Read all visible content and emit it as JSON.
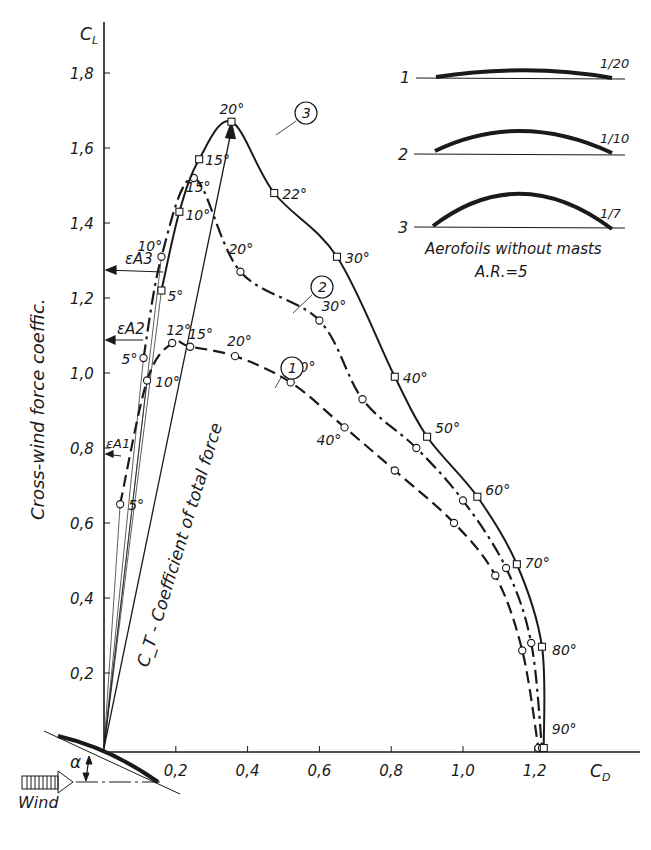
{
  "chart_data": {
    "type": "line",
    "xlabel": "C_D",
    "ylabel": "C_L",
    "ylabel_text": "Cross-wind force coeffic.",
    "total_force_label": "C_T - Coefficient of total force",
    "x_ticks": [
      "0,2",
      "0,4",
      "0,6",
      "0,8",
      "1,0",
      "1,2"
    ],
    "y_ticks": [
      "0,2",
      "0,4",
      "0,6",
      "0,8",
      "1,0",
      "1,2",
      "1,4",
      "1,6",
      "1,8"
    ],
    "xlim": [
      0,
      1.4
    ],
    "ylim": [
      0,
      1.9
    ],
    "grid": false,
    "series": [
      {
        "name": "1",
        "camber": "1/20",
        "style": "dashed",
        "marker": "circle",
        "points": [
          {
            "angle": "5°",
            "cd": 0.045,
            "cl": 0.65
          },
          {
            "angle": "10°",
            "cd": 0.12,
            "cl": 0.98
          },
          {
            "angle": "12°",
            "cd": 0.19,
            "cl": 1.08
          },
          {
            "angle": "15°",
            "cd": 0.24,
            "cl": 1.07
          },
          {
            "angle": "20°",
            "cd": 0.365,
            "cl": 1.045
          },
          {
            "angle": "30°",
            "cd": 0.52,
            "cl": 0.975
          },
          {
            "angle": "40°",
            "cd": 0.67,
            "cl": 0.855
          },
          {
            "angle": "50°",
            "cd": 0.81,
            "cl": 0.74
          },
          {
            "angle": "60°",
            "cd": 0.975,
            "cl": 0.6
          },
          {
            "angle": "70°",
            "cd": 1.09,
            "cl": 0.46
          },
          {
            "angle": "80°",
            "cd": 1.165,
            "cl": 0.26
          },
          {
            "angle": "90°",
            "cd": 1.21,
            "cl": 0.0
          }
        ]
      },
      {
        "name": "2",
        "camber": "1/10",
        "style": "dash-dot",
        "marker": "circle",
        "points": [
          {
            "angle": "5°",
            "cd": 0.11,
            "cl": 1.04
          },
          {
            "angle": "10°",
            "cd": 0.16,
            "cl": 1.31
          },
          {
            "angle": "15°",
            "cd": 0.25,
            "cl": 1.52
          },
          {
            "angle": "20°",
            "cd": 0.38,
            "cl": 1.27
          },
          {
            "angle": "30°",
            "cd": 0.6,
            "cl": 1.14
          },
          {
            "angle": "40°",
            "cd": 0.72,
            "cl": 0.93
          },
          {
            "angle": "50°",
            "cd": 0.87,
            "cl": 0.8
          },
          {
            "angle": "60°",
            "cd": 1.0,
            "cl": 0.66
          },
          {
            "angle": "70°",
            "cd": 1.12,
            "cl": 0.48
          },
          {
            "angle": "80°",
            "cd": 1.19,
            "cl": 0.28
          },
          {
            "angle": "90°",
            "cd": 1.22,
            "cl": 0.0
          }
        ]
      },
      {
        "name": "3",
        "camber": "1/7",
        "style": "solid",
        "marker": "square",
        "points": [
          {
            "angle": "5°",
            "cd": 0.16,
            "cl": 1.22
          },
          {
            "angle": "10°",
            "cd": 0.21,
            "cl": 1.43
          },
          {
            "angle": "15°",
            "cd": 0.265,
            "cl": 1.57
          },
          {
            "angle": "20°",
            "cd": 0.355,
            "cl": 1.67
          },
          {
            "angle": "22°",
            "cd": 0.474,
            "cl": 1.48
          },
          {
            "angle": "30°",
            "cd": 0.649,
            "cl": 1.31
          },
          {
            "angle": "40°",
            "cd": 0.81,
            "cl": 0.99
          },
          {
            "angle": "50°",
            "cd": 0.9,
            "cl": 0.83
          },
          {
            "angle": "60°",
            "cd": 1.04,
            "cl": 0.67
          },
          {
            "angle": "70°",
            "cd": 1.15,
            "cl": 0.49
          },
          {
            "angle": "80°",
            "cd": 1.22,
            "cl": 0.27
          },
          {
            "angle": "90°",
            "cd": 1.225,
            "cl": 0.0
          }
        ]
      }
    ],
    "annotations": {
      "epsilon_labels": [
        "εA1",
        "εA2",
        "εA3"
      ],
      "legend_title": "Aerofoils without masts",
      "aspect_ratio": "A.R.=5",
      "profiles": [
        {
          "id": "1",
          "camber": "1/20"
        },
        {
          "id": "2",
          "camber": "1/10"
        },
        {
          "id": "3",
          "camber": "1/7"
        }
      ],
      "wind_label": "Wind",
      "alpha_label": "α"
    }
  }
}
